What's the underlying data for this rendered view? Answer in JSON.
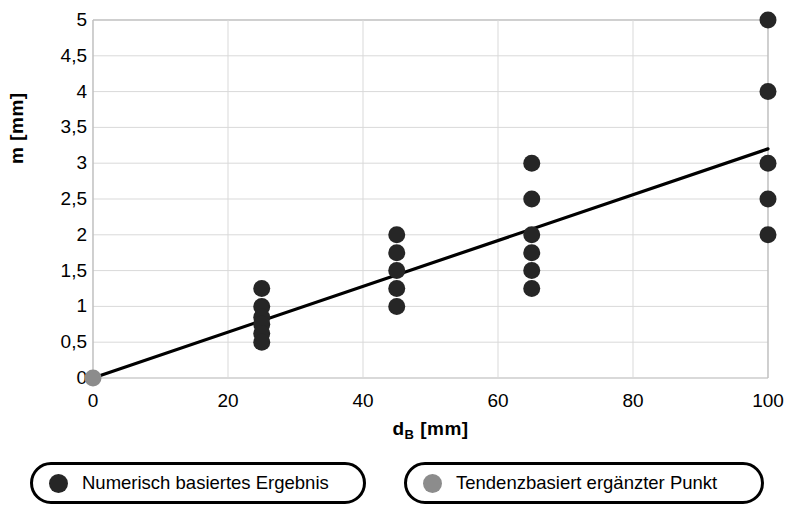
{
  "chart_data": {
    "type": "scatter",
    "title": "",
    "xlabel": "d_B [mm]",
    "xlabel_base": "d",
    "xlabel_sub": "B",
    "xlabel_unit": " [mm]",
    "ylabel": "m [mm]",
    "xlim": [
      0,
      100
    ],
    "ylim": [
      0,
      5
    ],
    "grid": true,
    "xticks": [
      0,
      20,
      40,
      60,
      80,
      100
    ],
    "xtick_labels": [
      "0",
      "20",
      "40",
      "60",
      "80",
      "100"
    ],
    "yticks": [
      0,
      0.5,
      1,
      1.5,
      2,
      2.5,
      3,
      3.5,
      4,
      4.5,
      5
    ],
    "ytick_labels": [
      "0",
      "0,5",
      "1",
      "1,5",
      "2",
      "2,5",
      "3",
      "3,5",
      "4",
      "4,5",
      "5"
    ],
    "legend_position": "below",
    "series": [
      {
        "name": "Numerisch basiertes Ergebnis",
        "marker": "circle",
        "color": "#262626",
        "points": [
          {
            "x": 25,
            "y": 1.25
          },
          {
            "x": 25,
            "y": 1.0
          },
          {
            "x": 25,
            "y": 0.85
          },
          {
            "x": 25,
            "y": 0.75
          },
          {
            "x": 25,
            "y": 0.62
          },
          {
            "x": 25,
            "y": 0.5
          },
          {
            "x": 45,
            "y": 2.0
          },
          {
            "x": 45,
            "y": 1.75
          },
          {
            "x": 45,
            "y": 1.5
          },
          {
            "x": 45,
            "y": 1.25
          },
          {
            "x": 45,
            "y": 1.0
          },
          {
            "x": 65,
            "y": 3.0
          },
          {
            "x": 65,
            "y": 2.5
          },
          {
            "x": 65,
            "y": 2.0
          },
          {
            "x": 65,
            "y": 1.75
          },
          {
            "x": 65,
            "y": 1.5
          },
          {
            "x": 65,
            "y": 1.25
          },
          {
            "x": 100,
            "y": 5.0
          },
          {
            "x": 100,
            "y": 4.0
          },
          {
            "x": 100,
            "y": 3.0
          },
          {
            "x": 100,
            "y": 2.5
          },
          {
            "x": 100,
            "y": 2.0
          }
        ]
      },
      {
        "name": "Tendenzbasiert ergänzter Punkt",
        "marker": "circle",
        "color": "#8c8c8c",
        "points": [
          {
            "x": 0,
            "y": 0
          }
        ]
      }
    ],
    "trendline": {
      "name": "trendline",
      "color": "#000000",
      "x0": 0,
      "y0": 0,
      "x1": 100,
      "y1": 3.2
    }
  },
  "legend": {
    "items": [
      {
        "label": "Numerisch basiertes Ergebnis",
        "color": "#262626"
      },
      {
        "label": "Tendenzbasiert ergänzter Punkt",
        "color": "#8c8c8c"
      }
    ]
  },
  "colors": {
    "numeric_marker": "#262626",
    "tendency_marker": "#8c8c8c",
    "trendline": "#000000",
    "grid": "#d9d9d9",
    "axis": "#b3b3b3",
    "background": "#ffffff"
  }
}
